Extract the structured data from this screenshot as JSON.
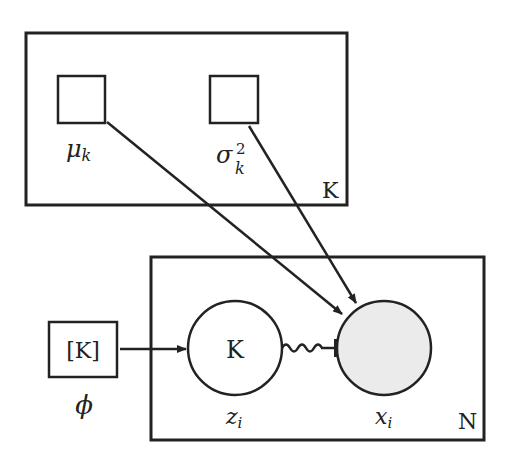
{
  "diagram": {
    "type": "plate notation graphical model",
    "plates": [
      {
        "label": "K",
        "contains": [
          "mu_k",
          "sigma2_k"
        ]
      },
      {
        "label": "N",
        "contains": [
          "z_i",
          "x_i"
        ]
      }
    ],
    "nodes": {
      "mu": {
        "base": "μ",
        "sub": "k",
        "shape": "square"
      },
      "sigma": {
        "base": "σ",
        "sub": "k",
        "sup": "2",
        "shape": "square"
      },
      "phi": {
        "inner": "[K]",
        "label": "ϕ",
        "shape": "square"
      },
      "z": {
        "inner": "K",
        "base": "z",
        "sub": "i",
        "shape": "circle"
      },
      "x": {
        "base": "x",
        "sub": "i",
        "shape": "circle",
        "observed": true
      }
    },
    "edges": [
      {
        "from": "mu",
        "to": "x",
        "style": "arrow"
      },
      {
        "from": "sigma",
        "to": "x",
        "style": "arrow"
      },
      {
        "from": "phi",
        "to": "z",
        "style": "arrow"
      },
      {
        "from": "z",
        "to": "x",
        "style": "squiggle-gate"
      }
    ],
    "colors": {
      "stroke": "#222222",
      "observed_fill": "#ebebeb"
    }
  }
}
